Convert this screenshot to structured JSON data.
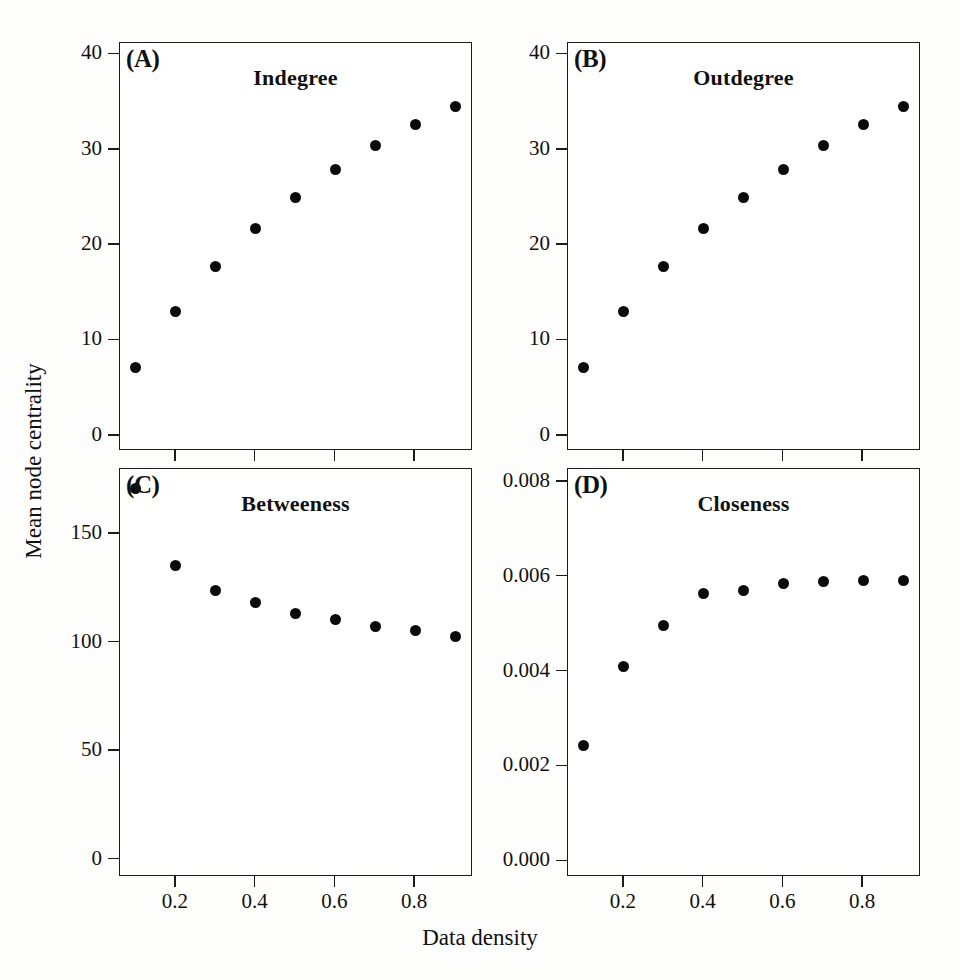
{
  "figure": {
    "xlabel": "Data density",
    "ylabel": "Mean node centrality",
    "marker_color": "#0b0b0b",
    "axis_color": "#1b1b1b",
    "background": "#fdfdfb"
  },
  "chart_data": [
    {
      "type": "scatter",
      "panel": "A",
      "panel_letter": "(A)",
      "title": "Indegree",
      "xlabel": "Data density",
      "ylabel": "Mean node centrality",
      "x": [
        0.1,
        0.2,
        0.3,
        0.4,
        0.5,
        0.6,
        0.7,
        0.8,
        0.9
      ],
      "values": [
        7.2,
        13.0,
        17.8,
        21.7,
        25.0,
        27.9,
        30.4,
        32.6,
        34.5
      ],
      "xlim": [
        0.06,
        0.945
      ],
      "ylim": [
        -1.6,
        41.2
      ],
      "xticks": [
        0.2,
        0.4,
        0.6,
        0.8
      ],
      "xticklabels": [
        "0.2",
        "0.4",
        "0.6",
        "0.8"
      ],
      "yticks": [
        0,
        10,
        20,
        30,
        40
      ],
      "yticklabels": [
        "0",
        "10",
        "20",
        "30",
        "40"
      ],
      "grid": false,
      "legend": "none"
    },
    {
      "type": "scatter",
      "panel": "B",
      "panel_letter": "(B)",
      "title": "Outdegree",
      "xlabel": "Data density",
      "ylabel": "Mean node centrality",
      "x": [
        0.1,
        0.2,
        0.3,
        0.4,
        0.5,
        0.6,
        0.7,
        0.8,
        0.9
      ],
      "values": [
        7.2,
        13.0,
        17.8,
        21.7,
        25.0,
        27.9,
        30.4,
        32.6,
        34.5
      ],
      "xlim": [
        0.06,
        0.945
      ],
      "ylim": [
        -1.6,
        41.2
      ],
      "xticks": [
        0.2,
        0.4,
        0.6,
        0.8
      ],
      "xticklabels": [
        "0.2",
        "0.4",
        "0.6",
        "0.8"
      ],
      "yticks": [
        0,
        10,
        20,
        30,
        40
      ],
      "yticklabels": [
        "0",
        "10",
        "20",
        "30",
        "40"
      ],
      "grid": false,
      "legend": "none"
    },
    {
      "type": "scatter",
      "panel": "C",
      "panel_letter": "(C)",
      "title": "Betweeness",
      "xlabel": "Data density",
      "ylabel": "Mean node centrality",
      "x": [
        0.1,
        0.2,
        0.3,
        0.4,
        0.5,
        0.6,
        0.7,
        0.8,
        0.9
      ],
      "values": [
        171.0,
        135.5,
        124.0,
        118.5,
        113.5,
        110.5,
        107.5,
        105.5,
        103.0
      ],
      "xlim": [
        0.06,
        0.945
      ],
      "ylim": [
        -8,
        180
      ],
      "xticks": [
        0.2,
        0.4,
        0.6,
        0.8
      ],
      "xticklabels": [
        "0.2",
        "0.4",
        "0.6",
        "0.8"
      ],
      "yticks": [
        0,
        50,
        100,
        150
      ],
      "yticklabels": [
        "0",
        "50",
        "100",
        "150"
      ],
      "grid": false,
      "legend": "none"
    },
    {
      "type": "scatter",
      "panel": "D",
      "panel_letter": "(D)",
      "title": "Closeness",
      "xlabel": "Data density",
      "ylabel": "Mean node centrality",
      "x": [
        0.1,
        0.2,
        0.3,
        0.4,
        0.5,
        0.6,
        0.7,
        0.8,
        0.9
      ],
      "values": [
        0.00245,
        0.00411,
        0.00498,
        0.00565,
        0.00571,
        0.00585,
        0.0059,
        0.00592,
        0.00593
      ],
      "xlim": [
        0.06,
        0.945
      ],
      "ylim": [
        -0.00033,
        0.00827
      ],
      "xticks": [
        0.2,
        0.4,
        0.6,
        0.8
      ],
      "xticklabels": [
        "0.2",
        "0.4",
        "0.6",
        "0.8"
      ],
      "yticks": [
        0.0,
        0.002,
        0.004,
        0.006,
        0.008
      ],
      "yticklabels": [
        "0.000",
        "0.002",
        "0.004",
        "0.006",
        "0.008"
      ],
      "grid": false,
      "legend": "none"
    }
  ]
}
